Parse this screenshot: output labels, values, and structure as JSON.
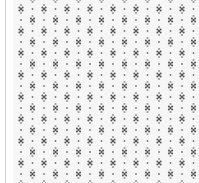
{
  "pattern": {
    "motif": "diamond-cluster",
    "filler": "dot",
    "period_x": 23,
    "period_y": 22,
    "origin_x": 21,
    "origin_y": 9,
    "colors": {
      "background": "#f6f6f6",
      "motif_dark": "#555555",
      "motif_light": "#9a9a9a",
      "dot": "#777777",
      "border": "#cfcfcf"
    }
  }
}
